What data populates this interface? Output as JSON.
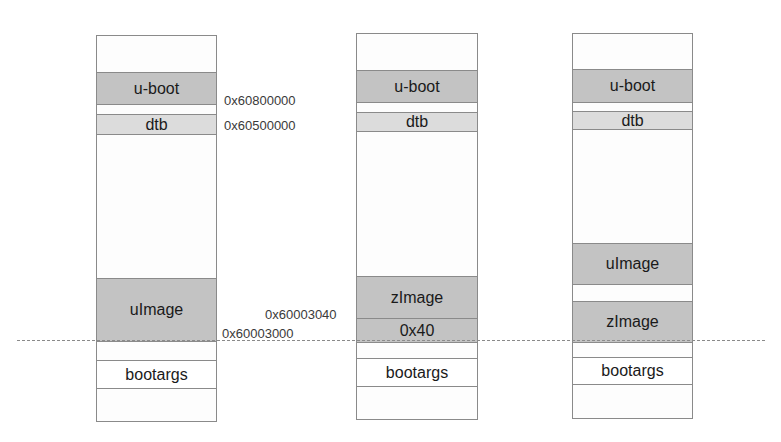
{
  "diagram": {
    "columns": [
      {
        "id": "memory-layout-uimage",
        "blocks": [
          {
            "label": "u-boot",
            "style": "dark"
          },
          {
            "label": "dtb",
            "style": "light"
          },
          {
            "label": "uImage",
            "style": "dark"
          },
          {
            "label": "bootargs",
            "style": "white"
          }
        ]
      },
      {
        "id": "memory-layout-zimage",
        "blocks": [
          {
            "label": "u-boot",
            "style": "dark"
          },
          {
            "label": "dtb",
            "style": "light"
          },
          {
            "label": "zImage",
            "style": "dark"
          },
          {
            "label": "0x40",
            "style": "dark"
          },
          {
            "label": "bootargs",
            "style": "white"
          }
        ]
      },
      {
        "id": "memory-layout-both",
        "blocks": [
          {
            "label": "u-boot",
            "style": "dark"
          },
          {
            "label": "dtb",
            "style": "light"
          },
          {
            "label": "uImage",
            "style": "dark"
          },
          {
            "label": "zImage",
            "style": "dark"
          },
          {
            "label": "bootargs",
            "style": "white"
          }
        ]
      }
    ],
    "addresses": {
      "uboot": "0x60800000",
      "dtb": "0x60500000",
      "zimage_start": "0x60003040",
      "load_base": "0x60003000"
    },
    "colors": {
      "dark_block": "#c3c3c3",
      "light_block": "#dcdcdc",
      "border": "#8a8a8a"
    }
  }
}
